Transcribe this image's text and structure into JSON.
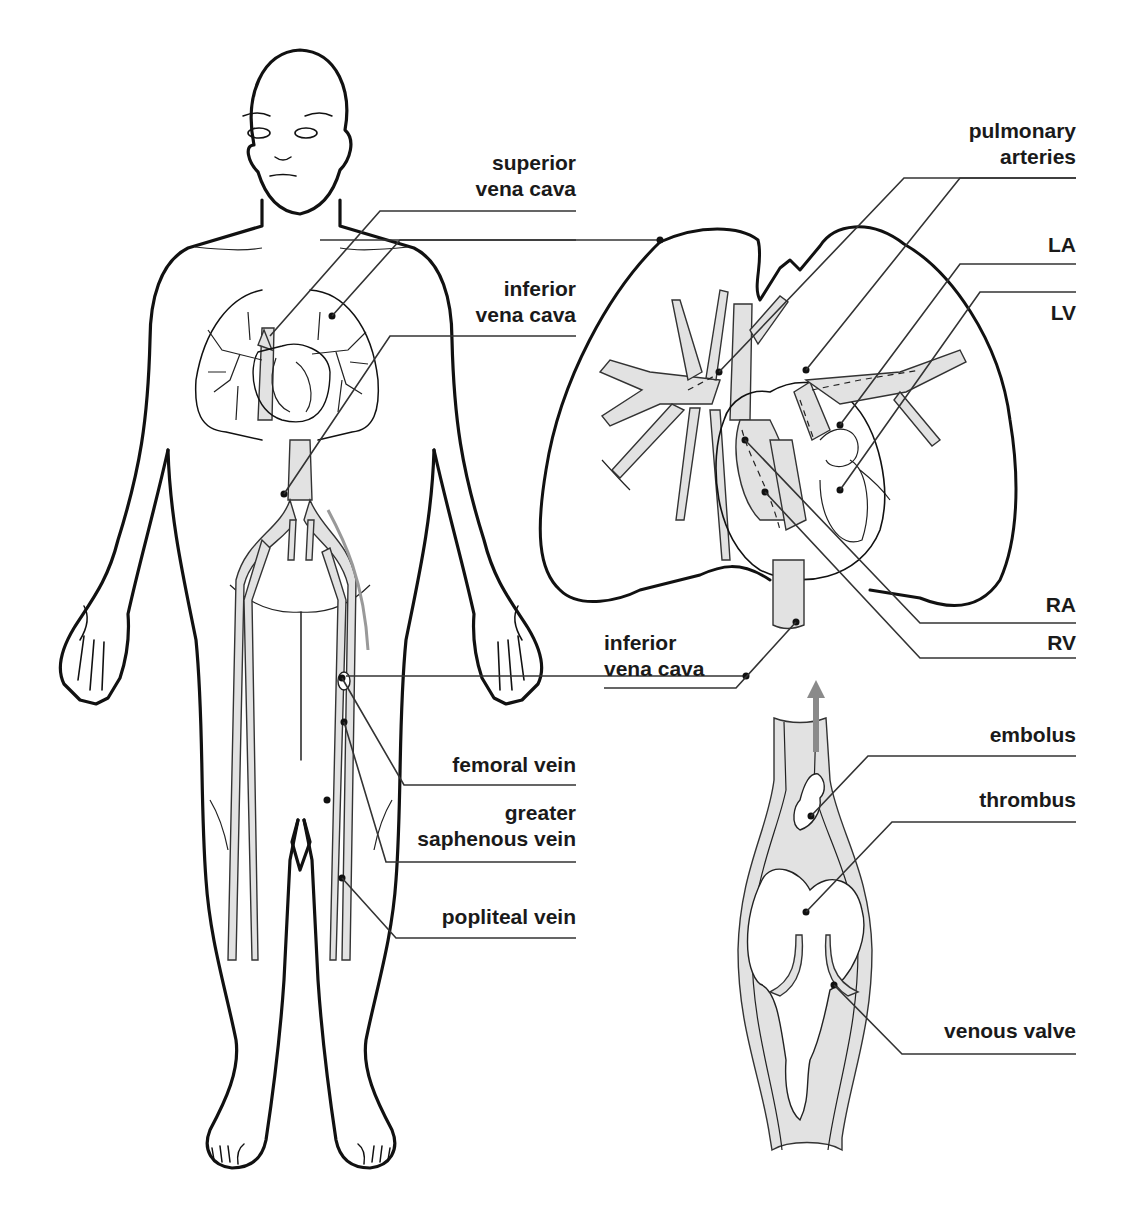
{
  "figure": {
    "panels": [
      "full-body venous system",
      "heart and lungs",
      "vein cross-section with venous valve"
    ]
  },
  "labels": {
    "superior_vena_cava": "superior\nvena cava",
    "inferior_vena_cava_body": "inferior\nvena cava",
    "femoral_vein": "femoral vein",
    "greater_saphenous_vein": "greater\nsaphenous vein",
    "popliteal_vein": "popliteal vein",
    "pulmonary_arteries": "pulmonary\narteries",
    "la": "LA",
    "lv": "LV",
    "ra": "RA",
    "rv": "RV",
    "inferior_vena_cava_heart": "inferior\nvena cava",
    "embolus": "embolus",
    "thrombus": "thrombus",
    "venous_valve": "venous valve"
  },
  "colors": {
    "ink": "#111111",
    "vessel_fill": "#e2e2e2",
    "flow_arrow": "#8a8a8a",
    "leader": "#333333",
    "background": "#ffffff"
  }
}
